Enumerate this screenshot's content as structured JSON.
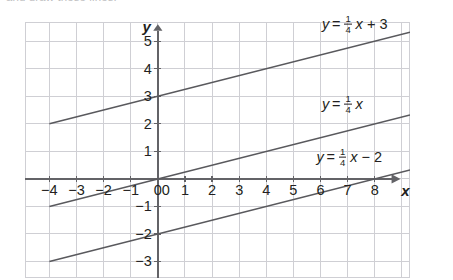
{
  "page": {
    "cut_off_instruction": "and draw these lines."
  },
  "chart_data": {
    "type": "line",
    "title": "",
    "xlabel": "x",
    "ylabel": "y",
    "xlim": [
      -4.9,
      9.3
    ],
    "ylim": [
      -3.6,
      5.7
    ],
    "xticks": [
      -4,
      -3,
      -2,
      -1,
      0,
      1,
      2,
      3,
      4,
      5,
      6,
      7,
      8
    ],
    "xticklabels": [
      "−4",
      "−3",
      "−2",
      "−1",
      "0",
      "1",
      "2",
      "3",
      "4",
      "5",
      "6",
      "7",
      "8"
    ],
    "yticks": [
      -3,
      -2,
      -1,
      1,
      2,
      3,
      4,
      5
    ],
    "yticklabels": [
      "−3",
      "−2",
      "−1",
      "1",
      "2",
      "3",
      "4",
      "5"
    ],
    "grid": true,
    "grid_color": "#cfcfd4",
    "axis_color": "#636367",
    "line_color": "#59595d",
    "legend": "inline-labels",
    "series": [
      {
        "name": "y = 1/4 x + 3",
        "slope": 0.25,
        "intercept": 3,
        "label_parts": {
          "lhs": "y",
          "eq": "=",
          "num": "1",
          "den": "4",
          "var": "x",
          "op": "+",
          "const": "3"
        },
        "x_start": -4.0,
        "x_end": 9.3,
        "y_start": 2.0,
        "y_end": 5.325,
        "label_x": 6.05,
        "label_y": 5.62
      },
      {
        "name": "y = 1/4 x",
        "slope": 0.25,
        "intercept": 0,
        "label_parts": {
          "lhs": "y",
          "eq": "=",
          "num": "1",
          "den": "4",
          "var": "x",
          "op": "",
          "const": ""
        },
        "x_start": -4.0,
        "x_end": 9.3,
        "y_start": -1.0,
        "y_end": 2.325,
        "label_x": 6.05,
        "label_y": 2.72
      },
      {
        "name": "y = 1/4 x − 2",
        "slope": 0.25,
        "intercept": -2,
        "label_parts": {
          "lhs": "y",
          "eq": "=",
          "num": "1",
          "den": "4",
          "var": "x",
          "op": "−",
          "const": "2"
        },
        "x_start": -4.0,
        "x_end": 9.3,
        "y_start": -3.0,
        "y_end": 0.325,
        "label_x": 5.85,
        "label_y": 0.78
      }
    ]
  }
}
